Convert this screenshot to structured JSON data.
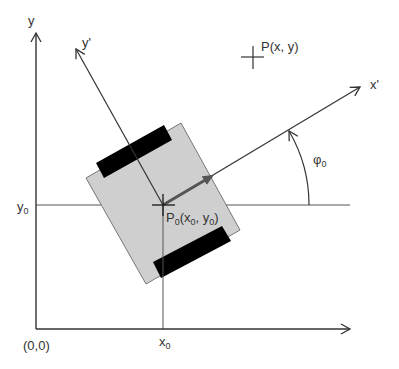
{
  "diagram": {
    "title": "",
    "colors": {
      "axis": "#333333",
      "body_fill": "#cfcfcf",
      "body_stroke": "#777777",
      "wheel": "#000000",
      "heading_arrow": "#555555",
      "background": "#ffffff"
    },
    "labels": {
      "y_axis": "y",
      "y_prime_axis": "y'",
      "x_prime_axis": "x'",
      "point_p": "P(x, y)",
      "angle_base": "φ",
      "angle_sub": "0",
      "y0_base": "y",
      "y0_sub": "0",
      "x0_base": "x",
      "x0_sub": "0",
      "origin": "(0,0)",
      "p0_base": "P",
      "p0_sub": "0",
      "p0_open": "(x",
      "p0_sub2": "0",
      "p0_mid": ", y",
      "p0_sub3": "0",
      "p0_close": ")"
    },
    "elements": [
      "world-x-axis",
      "world-y-axis",
      "robot-x-prime-axis",
      "robot-y-prime-axis",
      "robot-body",
      "left-wheel",
      "right-wheel",
      "heading-arrow",
      "angle-arc",
      "point-p-marker",
      "y0-reference-line",
      "x0-reference-line"
    ]
  }
}
